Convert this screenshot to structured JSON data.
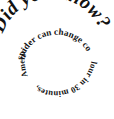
{
  "graphic": {
    "type": "spiral-text-graphic",
    "background_color": "#ffffff",
    "text_color": "#111111",
    "headline": "Did you know?",
    "fact_full": "A South American wolf spider can change colour in 30 minutes.",
    "fact_segments": {
      "segment_1": "spider can change co",
      "segment_2": "lour in 30 minutes,",
      "segment_3": "A South American wolf"
    }
  }
}
